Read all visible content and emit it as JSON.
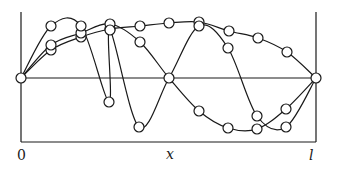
{
  "figure": {
    "labels": {
      "origin": "0",
      "x_axis": "x",
      "end": "l"
    },
    "frame": {
      "left_x": 21,
      "right_x": 316,
      "top_y": 12,
      "axis_y": 78,
      "bottom_y": 142
    },
    "stroke_color": "#1a1a1a",
    "curves": [
      {
        "name": "mode-1",
        "points": [
          [
            21,
            78
          ],
          [
            51,
            50
          ],
          [
            81,
            37
          ],
          [
            110,
            29
          ],
          [
            140,
            26
          ],
          [
            169,
            23
          ],
          [
            199,
            22
          ],
          [
            229,
            31
          ],
          [
            258,
            38
          ],
          [
            287,
            52
          ],
          [
            316,
            78
          ]
        ]
      },
      {
        "name": "mode-2",
        "points": [
          [
            21,
            78
          ],
          [
            51,
            45
          ],
          [
            81,
            33
          ],
          [
            110,
            24
          ],
          [
            140,
            42
          ],
          [
            169,
            78
          ],
          [
            199,
            111
          ],
          [
            228,
            128
          ],
          [
            257,
            129
          ],
          [
            286,
            109
          ],
          [
            316,
            78
          ]
        ]
      },
      {
        "name": "mode-3",
        "points": [
          [
            21,
            78
          ],
          [
            51,
            26
          ],
          [
            81,
            26
          ],
          [
            110,
            30
          ],
          [
            109,
            102
          ],
          [
            139,
            127
          ],
          [
            169,
            78
          ],
          [
            199,
            26
          ],
          [
            228,
            48
          ],
          [
            257,
            116
          ],
          [
            286,
            127
          ],
          [
            316,
            78
          ]
        ]
      }
    ],
    "node_markers": [
      [
        21,
        78
      ],
      [
        169,
        78
      ],
      [
        316,
        78
      ]
    ],
    "marker_radius": 5
  }
}
